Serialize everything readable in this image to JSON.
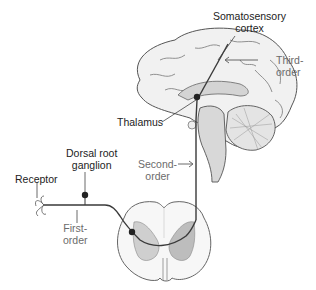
{
  "diagram": {
    "labels": {
      "somatosensory_cortex": [
        "Somatosensory",
        "cortex"
      ],
      "third_order": [
        "Third-",
        "order"
      ],
      "thalamus": "Thalamus",
      "dorsal_root_ganglion": [
        "Dorsal root",
        "ganglion"
      ],
      "receptor": "Receptor",
      "second_order": [
        "Second-",
        "order"
      ],
      "first_order": [
        "First-",
        "order"
      ]
    },
    "colors": {
      "outline": "#555555",
      "pathway": "#3a3a3a",
      "gray_matter": "#cfcfcf",
      "brain_fill": "#efefef",
      "label_text": "#222222",
      "order_text": "#6b6b6b"
    }
  }
}
